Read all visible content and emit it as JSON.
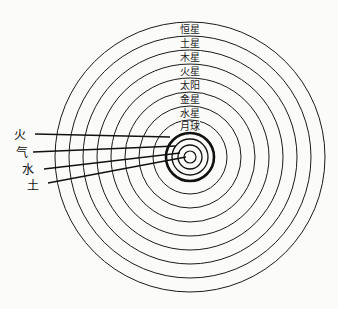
{
  "diagram": {
    "type": "geocentric-spheres",
    "center": {
      "x": 190,
      "y": 157
    },
    "colors": {
      "line": "#1a1a1a",
      "background": "#fbfbfa"
    },
    "celestial_spheres": [
      {
        "label": "恒星",
        "radius": 135
      },
      {
        "label": "土星",
        "radius": 121
      },
      {
        "label": "木星",
        "radius": 107
      },
      {
        "label": "火星",
        "radius": 93
      },
      {
        "label": "太阳",
        "radius": 79
      },
      {
        "label": "金星",
        "radius": 65
      },
      {
        "label": "水星",
        "radius": 51
      },
      {
        "label": "月球",
        "radius": 37
      }
    ],
    "elemental_spheres": [
      {
        "label": "火",
        "radius": 24,
        "thick": true
      },
      {
        "label": "气",
        "radius": 18
      },
      {
        "label": "水",
        "radius": 12
      },
      {
        "label": "土",
        "radius": 6
      }
    ],
    "labels": {
      "s0": "恒星",
      "s1": "土星",
      "s2": "木星",
      "s3": "火星",
      "s4": "太阳",
      "s5": "金星",
      "s6": "水星",
      "s7": "月球",
      "e0": "火",
      "e1": "气",
      "e2": "水",
      "e3": "土"
    }
  }
}
